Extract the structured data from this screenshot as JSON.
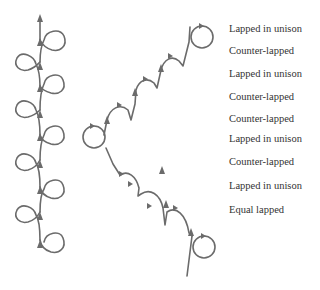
{
  "diagram": {
    "stroke_color": "#6b6b6b",
    "text_color": "#333333",
    "labels": [
      {
        "text": "Lapped in unison",
        "y": 29
      },
      {
        "text": "Counter-lapped",
        "y": 51
      },
      {
        "text": "Lapped in unison",
        "y": 74
      },
      {
        "text": "Counter-lapped",
        "y": 97
      },
      {
        "text": "Counter-lapped",
        "y": 119
      },
      {
        "text": "Lapped in unison",
        "y": 139
      },
      {
        "text": "Counter-lapped",
        "y": 162
      },
      {
        "text": "Lapped in unison",
        "y": 186
      },
      {
        "text": "Equal lapped",
        "y": 210
      }
    ],
    "left_chain": {
      "description": "Alternating right and left loops along a vertical upward path",
      "loop_count": 10
    },
    "zigzag_chain": {
      "description": "Zigzag path from bottom-right loop to left loop to top-right loop",
      "loop_count": 3
    }
  }
}
